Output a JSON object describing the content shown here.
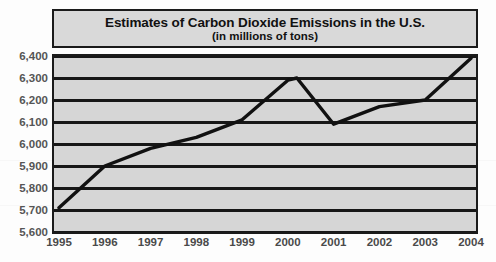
{
  "chart_data": {
    "type": "line",
    "title": "Estimates of Carbon Dioxide Emissions in the U.S.",
    "subtitle": "(in millions of tons)",
    "xlabel": "",
    "ylabel": "",
    "categories": [
      "1995",
      "1996",
      "1997",
      "1998",
      "1999",
      "2000",
      "2001",
      "2002",
      "2003",
      "2004"
    ],
    "x": [
      1995,
      1996,
      1997,
      1998,
      1999,
      2000,
      2001,
      2002,
      2003,
      2004
    ],
    "values": [
      5710,
      5900,
      5980,
      6030,
      6110,
      6290,
      6090,
      6170,
      6200,
      6390
    ],
    "series": [
      {
        "name": "Carbon Dioxide Emissions",
        "values": [
          5710,
          5900,
          5980,
          6030,
          6110,
          6290,
          6090,
          6170,
          6200,
          6390
        ]
      }
    ],
    "ylim": [
      5600,
      6400
    ],
    "xlim": [
      1995,
      2004
    ],
    "yticks": [
      5600,
      5700,
      5800,
      5900,
      6000,
      6100,
      6200,
      6300,
      6400
    ],
    "ytick_labels": [
      "5,600",
      "5,700",
      "5,800",
      "5,900",
      "6,000",
      "6,100",
      "6,200",
      "6,300",
      "6,400"
    ],
    "xtick_labels": [
      "1995",
      "1996",
      "1997",
      "1998",
      "1999",
      "2000",
      "2001",
      "2002",
      "2003",
      "2004"
    ],
    "grid": true,
    "legend": false,
    "line_color": "#111111",
    "plot_background": "#d6d6d6",
    "title_background": "#d9d9d9",
    "border_color": "#1b1b1b",
    "tick_label_color": "#4a4a4a"
  }
}
